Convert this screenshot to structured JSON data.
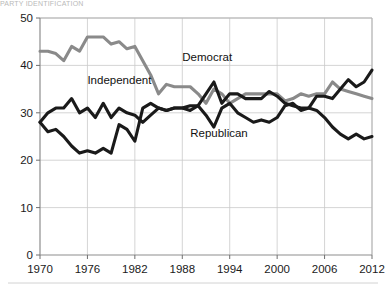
{
  "figure": {
    "clipped_header_text": "PARTY IDENTIFICATION",
    "width": 386,
    "height": 290
  },
  "colors": {
    "democrat": "#8a8a8a",
    "independent": "#1a1a1a",
    "republican": "#1a1a1a",
    "grid": "#c9c9c9",
    "axis": "#8d8d8d",
    "text": "#1a1a1a",
    "background": "#ffffff"
  },
  "labels": {
    "democrat": "Democrat",
    "independent": "Independent",
    "republican": "Republican"
  },
  "axis": {
    "y_ticks": [
      "0",
      "10",
      "20",
      "30",
      "40",
      "50"
    ],
    "x_ticks": [
      "1970",
      "1976",
      "1982",
      "1988",
      "1994",
      "2000",
      "2006",
      "2012"
    ]
  },
  "chart_data": {
    "type": "line",
    "title": "",
    "xlabel": "",
    "ylabel": "",
    "xlim": [
      1970,
      2012
    ],
    "ylim": [
      0,
      50
    ],
    "yticks": [
      0,
      10,
      20,
      30,
      40,
      50
    ],
    "xticks": [
      1970,
      1976,
      1982,
      1988,
      1994,
      2000,
      2006,
      2012
    ],
    "grid": true,
    "legend": "inline-annotations",
    "x": [
      1970,
      1971,
      1972,
      1973,
      1974,
      1975,
      1976,
      1977,
      1978,
      1979,
      1980,
      1981,
      1982,
      1983,
      1984,
      1985,
      1986,
      1987,
      1988,
      1989,
      1990,
      1991,
      1992,
      1993,
      1994,
      1995,
      1996,
      1997,
      1998,
      1999,
      2000,
      2001,
      2002,
      2003,
      2004,
      2005,
      2006,
      2007,
      2008,
      2009,
      2010,
      2011,
      2012
    ],
    "series": [
      {
        "name": "Democrat",
        "color": "#8a8a8a",
        "values": [
          43,
          43,
          42.5,
          41,
          44,
          43,
          46,
          46,
          46,
          44.5,
          45,
          43.5,
          44,
          41,
          38,
          34,
          36,
          35.5,
          35.5,
          35.5,
          34,
          32,
          35,
          34,
          32,
          33,
          34,
          34,
          34,
          34,
          34,
          32.5,
          33,
          34,
          33.5,
          34,
          34,
          36.5,
          35,
          34.5,
          34,
          33.5,
          33
        ]
      },
      {
        "name": "Independent",
        "color": "#1a1a1a",
        "values": [
          28,
          30,
          31,
          31,
          33,
          30,
          31,
          29,
          32,
          29,
          31,
          30,
          29.5,
          28,
          29.5,
          31,
          30.5,
          31,
          31,
          30.5,
          31.5,
          34,
          36.5,
          32,
          34,
          34,
          33,
          33,
          33,
          34.5,
          33.5,
          32,
          31.5,
          31,
          31,
          33.5,
          33.5,
          33,
          35,
          37,
          35.5,
          36.5,
          39
        ]
      },
      {
        "name": "Republican",
        "color": "#1a1a1a",
        "values": [
          28,
          26,
          26.5,
          25,
          23,
          21.5,
          22,
          21.5,
          22.5,
          21.5,
          27.5,
          26.5,
          24,
          31,
          32,
          31,
          30.5,
          31,
          31,
          31.5,
          31.5,
          29.5,
          27,
          31,
          32,
          30,
          29,
          28,
          28.5,
          28,
          29,
          31.5,
          32,
          30.5,
          31,
          30.5,
          29,
          27,
          25.5,
          24.5,
          25.5,
          24.5,
          25
        ]
      }
    ],
    "annotations": [
      {
        "text": "Democrat",
        "x": 1988,
        "y": 41
      },
      {
        "text": "Independent",
        "x": 1976,
        "y": 36
      },
      {
        "text": "Republican",
        "x": 1989,
        "y": 25
      }
    ]
  }
}
